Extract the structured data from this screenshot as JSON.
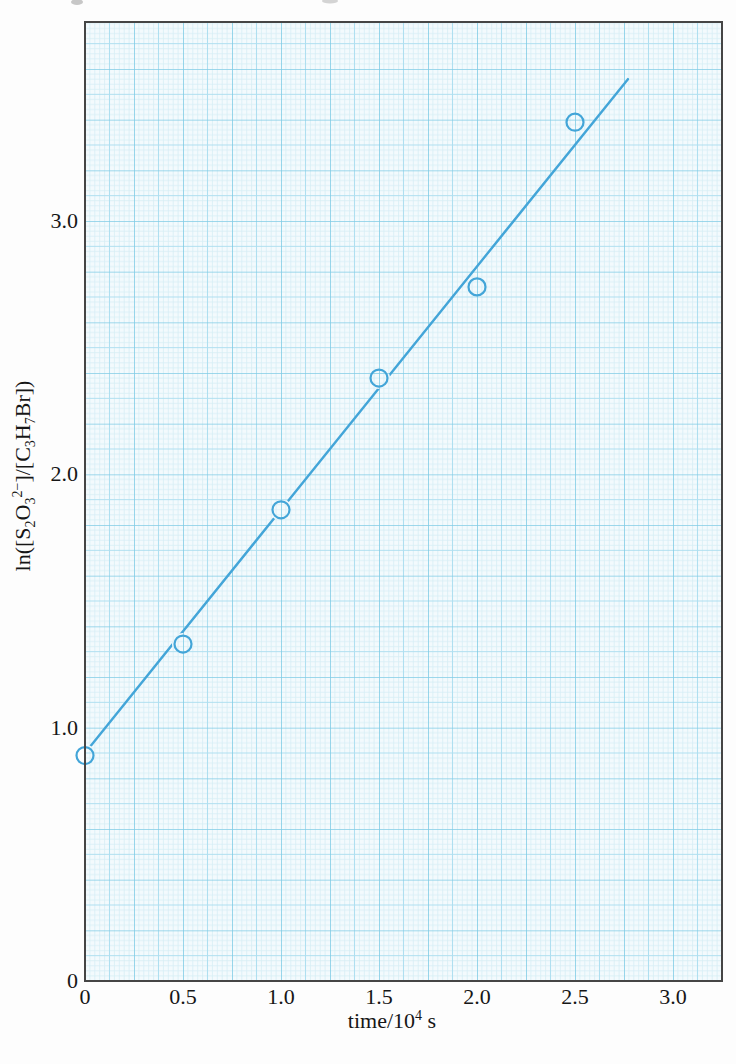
{
  "chart_data": {
    "type": "scatter",
    "title": "",
    "xlabel": "time/10⁴ s",
    "ylabel": "ln([S₂O₃²⁻]/[C₃H₇Br])",
    "xlabel_parts": [
      {
        "t": "time/10"
      },
      {
        "t": "4",
        "style": "sup"
      },
      {
        "t": " s"
      }
    ],
    "ylabel_parts": [
      {
        "t": "ln([S"
      },
      {
        "t": "2",
        "style": "sub"
      },
      {
        "t": "O"
      },
      {
        "t": "3",
        "style": "sub"
      },
      {
        "t": "2−",
        "style": "sup"
      },
      {
        "t": "]/[C"
      },
      {
        "t": "3",
        "style": "sub"
      },
      {
        "t": "H"
      },
      {
        "t": "7",
        "style": "sub"
      },
      {
        "t": "Br])"
      }
    ],
    "x_ticks": {
      "values": [
        0,
        0.5,
        1.0,
        1.5,
        2.0,
        2.5,
        3.0
      ],
      "labels": [
        "0",
        "0.5",
        "1.0",
        "1.5",
        "2.0",
        "2.5",
        "3.0"
      ]
    },
    "y_ticks": {
      "values": [
        0,
        1.0,
        2.0,
        3.0
      ],
      "labels": [
        "0",
        "1.0",
        "2.0",
        "3.0"
      ]
    },
    "xlim": [
      0,
      3.25
    ],
    "ylim": [
      0,
      3.79
    ],
    "grid": "graph-paper fine/medium/major, on",
    "legend": "none",
    "points": [
      {
        "x": 0.0,
        "y": 0.89
      },
      {
        "x": 0.5,
        "y": 1.33
      },
      {
        "x": 1.0,
        "y": 1.86
      },
      {
        "x": 1.5,
        "y": 2.38
      },
      {
        "x": 2.0,
        "y": 2.74
      },
      {
        "x": 2.5,
        "y": 3.39
      }
    ],
    "fit_line": {
      "x1": 0.0,
      "y1": 0.9,
      "x2": 2.77,
      "y2": 3.56
    },
    "colors": {
      "data": "#43a5d8",
      "grid_fine": "#d6edf5",
      "grid_medium": "#afdff0",
      "grid_major": "#80cce5",
      "paper": "#f3fafd",
      "border": "#454545",
      "text": "#161616"
    }
  }
}
